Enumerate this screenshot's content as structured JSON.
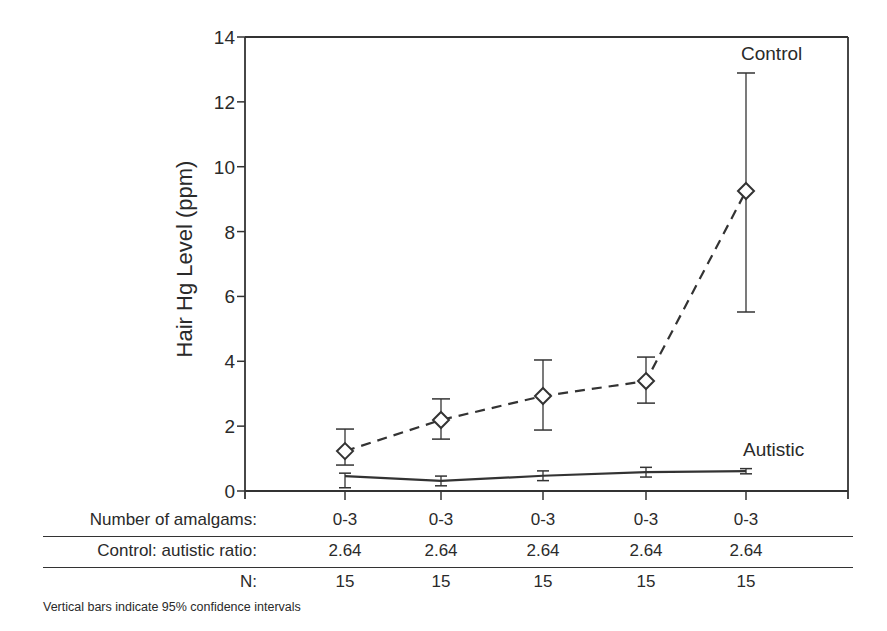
{
  "chart_data": {
    "type": "line",
    "title": "",
    "xlabel": "Number of amalgams",
    "ylabel": "Hair Hg Level (ppm)",
    "ylim": [
      0,
      14
    ],
    "yticks": [
      0,
      2,
      4,
      6,
      8,
      10,
      12,
      14
    ],
    "grid": false,
    "categories": [
      "0-3",
      "0-3",
      "0-3",
      "0-3",
      "0-3"
    ],
    "series": [
      {
        "name": "Control",
        "style": "dashed",
        "marker": "diamond",
        "values": [
          1.23,
          2.19,
          2.93,
          3.39,
          9.25
        ],
        "ci_low": [
          0.8,
          1.6,
          1.88,
          2.71,
          5.52
        ],
        "ci_high": [
          1.91,
          2.84,
          4.04,
          4.13,
          12.89
        ]
      },
      {
        "name": "Autistic",
        "style": "solid",
        "marker": "none",
        "values": [
          0.46,
          0.31,
          0.47,
          0.58,
          0.61
        ],
        "ci_low": [
          0.1,
          0.16,
          0.32,
          0.43,
          0.53
        ],
        "ci_high": [
          0.55,
          0.46,
          0.62,
          0.73,
          0.69
        ]
      }
    ],
    "annotations": [
      "Control",
      "Autistic"
    ]
  },
  "table": {
    "rows": [
      {
        "label": "Number of amalgams:",
        "values": [
          "0-3",
          "0-3",
          "0-3",
          "0-3",
          "0-3"
        ]
      },
      {
        "label": "Control: autistic ratio:",
        "values": [
          "2.64",
          "2.64",
          "2.64",
          "2.64",
          "2.64"
        ]
      },
      {
        "label": "N:",
        "values": [
          "15",
          "15",
          "15",
          "15",
          "15"
        ]
      }
    ]
  },
  "footnote": "Vertical bars indicate 95% confidence intervals"
}
